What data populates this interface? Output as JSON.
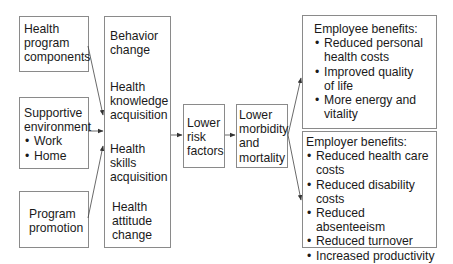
{
  "diagram": {
    "inputs": [
      {
        "id": "health-program-components",
        "lines": [
          "Health",
          "program",
          "components"
        ],
        "bullets": []
      },
      {
        "id": "supportive-environment",
        "lines": [
          "Supportive",
          "environment"
        ],
        "bullets": [
          "Work",
          "Home"
        ]
      },
      {
        "id": "program-promotion",
        "lines": [
          "Program",
          "promotion"
        ],
        "bullets": []
      }
    ],
    "outcomes_column": {
      "items": [
        {
          "lines": [
            "Behavior",
            "change"
          ]
        },
        {
          "lines": [
            "Health",
            "knowledge",
            "acquisition"
          ]
        },
        {
          "lines": [
            "Health",
            "skills",
            "acquisition"
          ]
        },
        {
          "lines": [
            "Health",
            "attitude",
            "change"
          ]
        }
      ]
    },
    "risk_factors": {
      "lines": [
        "Lower",
        "risk",
        "factors"
      ]
    },
    "morbidity": {
      "lines": [
        "Lower",
        "morbidity",
        "and",
        "mortality"
      ]
    },
    "employee_benefits": {
      "title": "Employee benefits:",
      "bullets": [
        [
          "Reduced personal",
          "health costs"
        ],
        [
          "Improved quality",
          "of life"
        ],
        [
          "More energy and",
          "vitality"
        ]
      ]
    },
    "employer_benefits": {
      "title": "Employer benefits:",
      "bullets": [
        [
          "Reduced health care",
          "costs"
        ],
        [
          "Reduced disability",
          "costs"
        ],
        [
          "Reduced absenteeism"
        ],
        [
          "Reduced turnover"
        ],
        [
          "Increased productivity"
        ]
      ]
    },
    "arrows": [
      {
        "from": "health-program-components",
        "to": "outcomes-column"
      },
      {
        "from": "supportive-environment",
        "to": "outcomes-column"
      },
      {
        "from": "program-promotion",
        "to": "outcomes-column"
      },
      {
        "from": "outcomes-column",
        "to": "risk-factors"
      },
      {
        "from": "risk-factors",
        "to": "morbidity"
      },
      {
        "from": "morbidity",
        "to": "employee-benefits"
      },
      {
        "from": "morbidity",
        "to": "employer-benefits"
      }
    ],
    "colors": {
      "line": "#333333",
      "border": "#8a8a8a",
      "text": "#1a1a1a"
    }
  }
}
